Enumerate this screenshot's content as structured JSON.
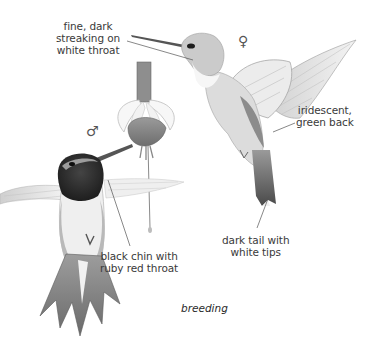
{
  "figure": {
    "caption": "breeding",
    "symbols": {
      "female": "♀",
      "male": "♂"
    },
    "labels": {
      "female_throat": [
        "fine, dark",
        "streaking on",
        "white throat"
      ],
      "female_back": [
        "iridescent,",
        "green back"
      ],
      "female_tail": [
        "dark tail with",
        "white tips"
      ],
      "male_throat": [
        "black chin with",
        "ruby red throat"
      ]
    },
    "colors": {
      "background": "#ffffff",
      "ink": "#3a3a3a",
      "leader_line": "#555555",
      "male_gorget": "#2b2b2b",
      "feather_gray": "#8a8a8a"
    }
  }
}
